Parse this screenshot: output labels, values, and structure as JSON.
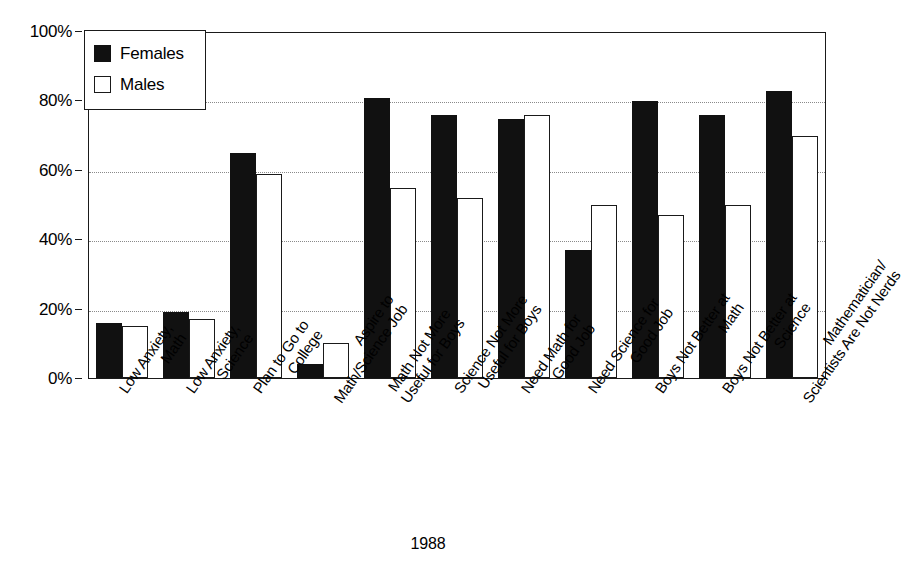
{
  "chart_data": {
    "type": "bar",
    "title": "",
    "subtitle": "",
    "xlabel": "1988",
    "ylabel": "",
    "ylim": [
      0,
      100
    ],
    "y_unit": "%",
    "grid": true,
    "grid_axis": "y",
    "legend_position": "top-left",
    "categories": [
      "Low Anxiety,\nMath",
      "Low Anxiety,\nScience",
      "Plan to Go to\nCollege",
      "Aspire to\nMath/Science Job",
      "Math Not More\nUseful for Boys",
      "Science Not More\nUseful for Boys",
      "Need Math for\nGood Job",
      "Need Science for\nGood Job",
      "Boys Not Better at\nMath",
      "Boys Not Better at\nScience",
      "Mathematician/\nScientists Are Not Nerds"
    ],
    "category_lines": [
      [
        "Low Anxiety,",
        "Math"
      ],
      [
        "Low Anxiety,",
        "Science"
      ],
      [
        "Plan to Go to",
        "College"
      ],
      [
        "Aspire to",
        "Math/Science Job"
      ],
      [
        "Math Not More",
        "Useful for Boys"
      ],
      [
        "Science Not More",
        "Useful for Boys"
      ],
      [
        "Need Math for",
        "Good Job"
      ],
      [
        "Need Science for",
        "Good Job"
      ],
      [
        "Boys Not Better at",
        "Math"
      ],
      [
        "Boys Not Better at",
        "Science"
      ],
      [
        "Mathematician/",
        "Scientists Are Not Nerds"
      ]
    ],
    "series": [
      {
        "name": "Females",
        "color": "#111111",
        "values": [
          16,
          19,
          65,
          4,
          81,
          76,
          75,
          37,
          80,
          76,
          83
        ]
      },
      {
        "name": "Males",
        "color": "#ffffff",
        "values": [
          15,
          17,
          59,
          10,
          55,
          52,
          76,
          50,
          47,
          50,
          70
        ]
      }
    ],
    "y_ticks": [
      0,
      20,
      40,
      60,
      80,
      100
    ],
    "y_tick_labels": [
      "0%",
      "20%",
      "40%",
      "60%",
      "80%",
      "100%"
    ]
  },
  "legend": {
    "entries": [
      {
        "label": "Females",
        "swatch": "filled-black-square"
      },
      {
        "label": "Males",
        "swatch": "open-white-square"
      }
    ]
  },
  "footer": {
    "year_label": "1988"
  }
}
